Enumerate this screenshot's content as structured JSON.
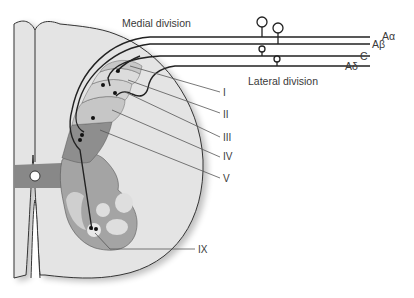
{
  "diagram": {
    "divisions": {
      "medial": "Medial division",
      "lateral": "Lateral division"
    },
    "fibers": [
      {
        "id": "a-alpha",
        "label": "Aα"
      },
      {
        "id": "a-beta",
        "label": "Aβ"
      },
      {
        "id": "c",
        "label": "C"
      },
      {
        "id": "a-delta",
        "label": "Aδ"
      }
    ],
    "laminae": [
      {
        "id": "I",
        "label": "I"
      },
      {
        "id": "II",
        "label": "II"
      },
      {
        "id": "III",
        "label": "III"
      },
      {
        "id": "IV",
        "label": "IV"
      },
      {
        "id": "V",
        "label": "V"
      },
      {
        "id": "IX",
        "label": "IX"
      }
    ],
    "colors": {
      "white_matter": "#e4e4e4",
      "outline": "#333333",
      "lamina_I": "#c8c8c8",
      "lamina_II": "#dcdcdc",
      "lamina_III": "#d2d2d2",
      "lamina_IV": "#c6c6c6",
      "lamina_V": "#8e8e8e",
      "central_grey": "#888888",
      "ventral_horn": "#a4a4a4",
      "motor_pools": "#dedede",
      "fiber": "#222222",
      "leader_line": "#555555"
    }
  }
}
